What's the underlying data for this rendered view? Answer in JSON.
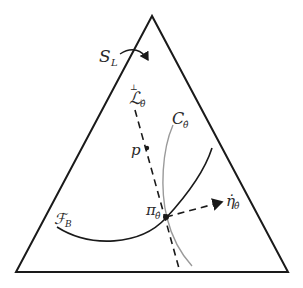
{
  "figure": {
    "type": "simplex-diagram",
    "labels": {
      "simplex": "S",
      "simplex_sub": "L",
      "line": "ℒ",
      "line_sup": "⊥",
      "line_sub": "θ̂",
      "point_p": "p",
      "curve_c": "C",
      "curve_c_sub": "θ̂",
      "family": "ℱ",
      "family_sub": "B",
      "projection": "π",
      "projection_sub": "θ̂",
      "tangent": "η̇",
      "tangent_sub": "θ̂"
    },
    "colors": {
      "stroke": "#1a1a1a",
      "curve_c": "#9a9a9a",
      "background": "#ffffff"
    }
  }
}
